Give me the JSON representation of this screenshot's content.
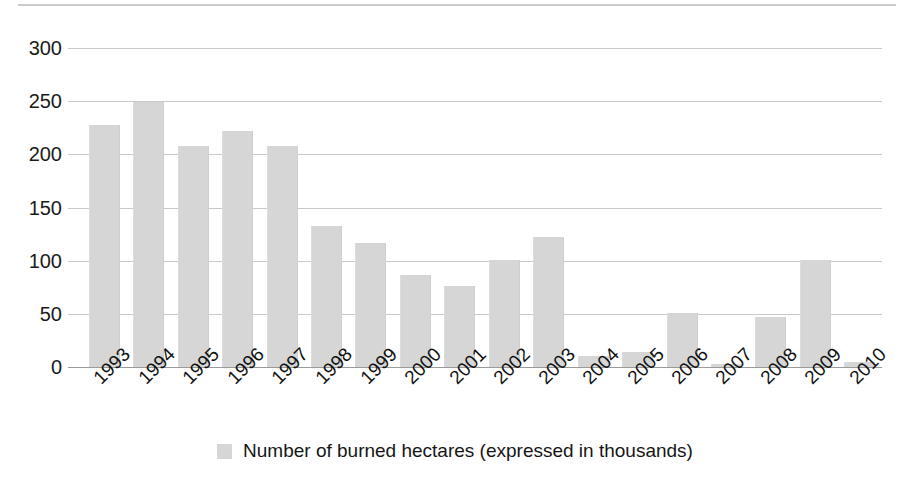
{
  "chart_data": {
    "type": "bar",
    "title": "",
    "subtitle": "",
    "xlabel": "",
    "ylabel": "",
    "categories": [
      "1993",
      "1994",
      "1995",
      "1996",
      "1997",
      "1998",
      "1999",
      "2000",
      "2001",
      "2002",
      "2003",
      "2004",
      "2005",
      "2006",
      "2007",
      "2008",
      "2009",
      "2010"
    ],
    "values": [
      228,
      249,
      208,
      222,
      208,
      133,
      117,
      87,
      76,
      101,
      122,
      10,
      14,
      51,
      3,
      47,
      101,
      5
    ],
    "series": [
      {
        "name": "Number of burned hectares (expressed in thousands)",
        "color": "#d6d6d6",
        "values": [
          228,
          249,
          208,
          222,
          208,
          133,
          117,
          87,
          76,
          101,
          122,
          10,
          14,
          51,
          3,
          47,
          101,
          5
        ]
      }
    ],
    "ylim": [
      0,
      300
    ],
    "yticks": [
      0,
      50,
      100,
      150,
      200,
      250,
      300
    ],
    "ytick_labels": [
      "0",
      "50",
      "100",
      "150",
      "200",
      "250",
      "300"
    ],
    "grid": true,
    "grid_axis": "y",
    "legend_position": "bottom-center",
    "legend_entries": [
      "Number of burned hectares (expressed in thousands)"
    ],
    "xtick_rotation": -45,
    "annotations": []
  },
  "legend": {
    "label": "Number of burned hectares (expressed in thousands)",
    "swatch_color": "#d6d6d6"
  },
  "colors": {
    "bar": "#d6d6d6",
    "gridline": "#c9c9c9",
    "axis": "#9a9a9a",
    "text": "#111111",
    "background": "#ffffff"
  }
}
